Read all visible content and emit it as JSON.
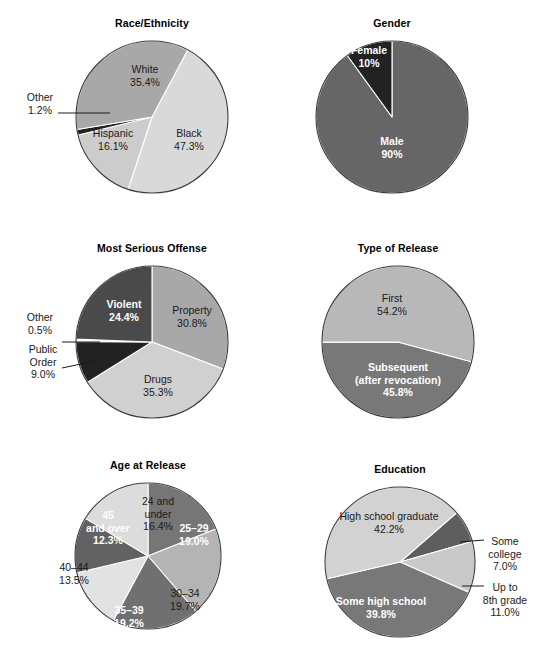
{
  "page": {
    "width": 544,
    "height": 660,
    "background": "#ffffff",
    "layout": "2 columns x 3 rows of pie charts"
  },
  "palette": {
    "very_light": "#d9d9d9",
    "light": "#cccccc",
    "mid_light": "#a8a8a8",
    "mid": "#8a8a8a",
    "mid_dark": "#666666",
    "dark": "#4a4a4a",
    "very_dark": "#222222",
    "outline": "#3a3a3a",
    "label_light": "#ffffff",
    "label_dark": "#1a1a1a"
  },
  "chart_data": [
    {
      "id": "race-ethnicity",
      "type": "pie",
      "title": "Race/Ethnicity",
      "cx": 152,
      "cy": 117,
      "r": 76,
      "start_angle": 28,
      "direction": "clockwise",
      "categories": [
        "Black",
        "Hispanic",
        "Other",
        "White"
      ],
      "values": [
        47.3,
        16.1,
        1.2,
        35.4
      ],
      "slices": [
        {
          "label": "Black",
          "value": "47.3%",
          "color": "#d9d9d9",
          "label_style": "dark",
          "label_lines": [
            "Black",
            "47.3%"
          ],
          "label_x": 189,
          "label_y": 137,
          "callout": false
        },
        {
          "label": "Hispanic",
          "value": "16.1%",
          "color": "#cccccc",
          "label_style": "dark",
          "label_lines": [
            "Hispanic",
            "16.1%"
          ],
          "label_x": 113,
          "label_y": 137,
          "callout": false
        },
        {
          "label": "Other",
          "value": "1.2%",
          "color": "#222222",
          "label_style": "dark",
          "label_lines": [
            "Other",
            "1.2%"
          ],
          "label_x": 40,
          "label_y": 101,
          "label_anchor": "middle",
          "callout": true,
          "leader": [
            58,
            113,
            110,
            113
          ]
        },
        {
          "label": "White",
          "value": "35.4%",
          "color": "#a8a8a8",
          "label_style": "dark",
          "label_lines": [
            "White",
            "35.4%"
          ],
          "label_x": 145,
          "label_y": 73,
          "callout": false
        }
      ]
    },
    {
      "id": "gender",
      "type": "pie",
      "title": "Gender",
      "cx": 392,
      "cy": 117,
      "r": 76,
      "start_angle": 0,
      "direction": "clockwise",
      "categories": [
        "Male",
        "Female"
      ],
      "values": [
        90,
        10
      ],
      "slices": [
        {
          "label": "Male",
          "value": "90%",
          "color": "#666666",
          "label_style": "light",
          "label_lines": [
            "Male",
            "90%"
          ],
          "label_x": 392,
          "label_y": 145,
          "callout": false
        },
        {
          "label": "Female",
          "value": "10%",
          "color": "#222222",
          "label_style": "light",
          "label_lines": [
            "Female",
            "10%"
          ],
          "label_x": 369,
          "label_y": 54,
          "callout": false
        }
      ]
    },
    {
      "id": "most-serious-offense",
      "type": "pie",
      "title": "Most Serious Offense",
      "cx": 152,
      "cy": 342,
      "r": 76,
      "start_angle": 0,
      "direction": "clockwise",
      "categories": [
        "Property",
        "Drugs",
        "Public Order",
        "Other",
        "Violent"
      ],
      "values": [
        30.8,
        35.3,
        9.0,
        0.5,
        24.4
      ],
      "slices": [
        {
          "label": "Property",
          "value": "30.8%",
          "color": "#a8a8a8",
          "label_style": "dark",
          "label_lines": [
            "Property",
            "30.8%"
          ],
          "label_x": 192,
          "label_y": 314,
          "callout": false
        },
        {
          "label": "Drugs",
          "value": "35.3%",
          "color": "#d0d0d0",
          "label_style": "dark",
          "label_lines": [
            "Drugs",
            "35.3%"
          ],
          "label_x": 158,
          "label_y": 383,
          "callout": false
        },
        {
          "label": "Public Order",
          "value": "9.0%",
          "color": "#222222",
          "label_style": "dark",
          "label_lines": [
            "Public",
            "Order",
            "9.0%"
          ],
          "label_x": 43,
          "label_y": 353,
          "label_anchor": "middle",
          "callout": true,
          "leader": [
            62,
            368,
            100,
            360
          ]
        },
        {
          "label": "Other",
          "value": "0.5%",
          "color": "#ffffff",
          "label_style": "dark",
          "label_lines": [
            "Other",
            "0.5%"
          ],
          "label_x": 40,
          "label_y": 321,
          "label_anchor": "middle",
          "callout": true,
          "leader": [
            62,
            342,
            100,
            342
          ]
        },
        {
          "label": "Violent",
          "value": "24.4%",
          "color": "#4a4a4a",
          "label_style": "light",
          "label_lines": [
            "Violent",
            "24.4%"
          ],
          "label_x": 124,
          "label_y": 308,
          "callout": false
        }
      ]
    },
    {
      "id": "type-of-release",
      "type": "pie",
      "title": "Type of Release",
      "cx": 398,
      "cy": 342,
      "r": 76,
      "start_angle": 105,
      "direction": "clockwise",
      "categories": [
        "Subsequent (after revocation)",
        "First"
      ],
      "values": [
        45.8,
        54.2
      ],
      "slices": [
        {
          "label": "Subsequent (after revocation)",
          "value": "45.8%",
          "color": "#787878",
          "label_style": "light",
          "label_lines": [
            "Subsequent",
            "(after revocation)",
            "45.8%"
          ],
          "label_x": 398,
          "label_y": 371,
          "callout": false
        },
        {
          "label": "First",
          "value": "54.2%",
          "color": "#b8b8b8",
          "label_style": "dark",
          "label_lines": [
            "First",
            "54.2%"
          ],
          "label_x": 392,
          "label_y": 302,
          "callout": false
        }
      ]
    },
    {
      "id": "age-at-release",
      "type": "pie",
      "title": "Age at Release",
      "cx": 148,
      "cy": 556,
      "r": 73,
      "start_angle": 0,
      "direction": "clockwise",
      "categories": [
        "25–29",
        "30–34",
        "35–39",
        "40–44",
        "45 and over",
        "24 and under"
      ],
      "values": [
        19.0,
        19.7,
        19.2,
        13.5,
        12.3,
        16.4
      ],
      "slices": [
        {
          "label": "25–29",
          "value": "19.0%",
          "color": "#767676",
          "label_style": "light",
          "label_lines": [
            "25–29",
            "19.0%"
          ],
          "label_x": 194,
          "label_y": 532,
          "callout": false
        },
        {
          "label": "30–34",
          "value": "19.7%",
          "color": "#b4b4b4",
          "label_style": "dark",
          "label_lines": [
            "30–34",
            "19.7%"
          ],
          "label_x": 185,
          "label_y": 597,
          "callout": false
        },
        {
          "label": "35–39",
          "value": "19.2%",
          "color": "#707070",
          "label_style": "light",
          "label_lines": [
            "35–39",
            "19.2%"
          ],
          "label_x": 129,
          "label_y": 614,
          "callout": false
        },
        {
          "label": "40–44",
          "value": "13.5%",
          "color": "#e2e2e2",
          "label_style": "dark",
          "label_lines": [
            "40–44",
            "13.5%"
          ],
          "label_x": 74,
          "label_y": 571,
          "callout": false
        },
        {
          "label": "45 and over",
          "value": "12.3%",
          "color": "#626262",
          "label_style": "light",
          "label_lines": [
            "45",
            "and over",
            "12.3%"
          ],
          "label_x": 108,
          "label_y": 519,
          "callout": false
        },
        {
          "label": "24 and under",
          "value": "16.4%",
          "color": "#dcdcdc",
          "label_style": "dark",
          "label_lines": [
            "24 and",
            "under",
            "16.4%"
          ],
          "label_x": 158,
          "label_y": 505,
          "callout": false
        }
      ]
    },
    {
      "id": "education",
      "type": "pie",
      "title": "Education",
      "cx": 400,
      "cy": 562,
      "r": 75,
      "start_angle": 49,
      "direction": "clockwise",
      "categories": [
        "Some college",
        "Up to 8th grade",
        "Some high school",
        "High school graduate"
      ],
      "values": [
        7.0,
        11.0,
        39.8,
        42.2
      ],
      "slices": [
        {
          "label": "Some college",
          "value": "7.0%",
          "color": "#5e5e5e",
          "label_style": "dark",
          "label_lines": [
            "Some",
            "college",
            "7.0%"
          ],
          "label_x": 505,
          "label_y": 545,
          "label_anchor": "middle",
          "callout": true,
          "leader": [
            460,
            542,
            484,
            540
          ]
        },
        {
          "label": "Up to 8th grade",
          "value": "11.0%",
          "color": "#c9c9c9",
          "label_style": "dark",
          "label_lines": [
            "Up to",
            "8th grade",
            "11.0%"
          ],
          "label_x": 505,
          "label_y": 591,
          "label_anchor": "middle",
          "callout": true,
          "leader": [
            462,
            586,
            484,
            586
          ]
        },
        {
          "label": "Some high school",
          "value": "39.8%",
          "color": "#787878",
          "label_style": "light",
          "label_lines": [
            "Some high school",
            "39.8%"
          ],
          "label_x": 381,
          "label_y": 605,
          "callout": false
        },
        {
          "label": "High school graduate",
          "value": "42.2%",
          "color": "#d2d2d2",
          "label_style": "dark",
          "label_lines": [
            "High school graduate",
            "42.2%"
          ],
          "label_x": 389,
          "label_y": 520,
          "callout": false
        }
      ]
    }
  ]
}
